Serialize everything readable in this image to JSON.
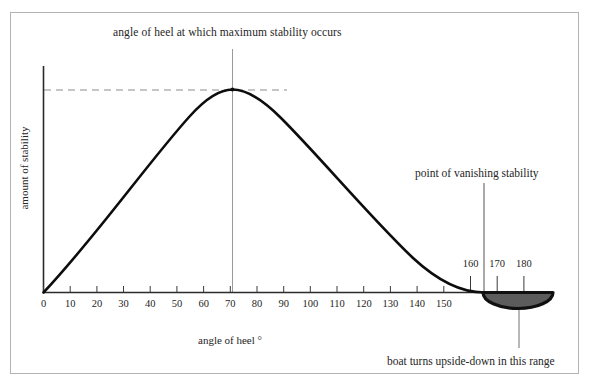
{
  "figure": {
    "title": "angle of heel at which maximum stability occurs",
    "annotation_vanishing": "point of vanishing stability",
    "annotation_boat": "boat turns upside-down in this range",
    "x_axis_title": "angle of heel °",
    "y_axis_title": "amount of stability"
  },
  "chart_data": {
    "type": "line",
    "title": "angle of heel at which maximum stability occurs",
    "xlabel": "angle of heel °",
    "ylabel": "amount of stability",
    "xlim": [
      0,
      180
    ],
    "ylim": [
      0,
      1.15
    ],
    "grid": false,
    "legend": null,
    "x_ticks": [
      0,
      10,
      20,
      30,
      40,
      50,
      60,
      70,
      80,
      90,
      100,
      110,
      120,
      130,
      140,
      150
    ],
    "x_ticks_upper": [
      160,
      170,
      180
    ],
    "y_ticks": [],
    "series": [
      {
        "name": "righting moment curve",
        "x": [
          0,
          10,
          20,
          30,
          40,
          50,
          60,
          67,
          70,
          80,
          90,
          100,
          110,
          120,
          130,
          140,
          150,
          160,
          165
        ],
        "values": [
          0.0,
          0.24,
          0.47,
          0.67,
          0.83,
          0.94,
          0.995,
          1.0,
          0.995,
          0.96,
          0.89,
          0.79,
          0.66,
          0.51,
          0.36,
          0.22,
          0.09,
          0.01,
          0.0
        ]
      }
    ],
    "annotations": [
      {
        "label": "angle of heel at which maximum stability occurs",
        "x": 67,
        "y": 1.0,
        "kind": "peak-callout"
      },
      {
        "label": "point of vanishing stability",
        "x": 165,
        "y": 0.0,
        "kind": "zero-crossing-callout"
      },
      {
        "label": "boat turns upside-down in this range",
        "x": 178,
        "y": -0.18,
        "kind": "region-callout"
      }
    ],
    "max_stability_angle": 67,
    "vanishing_stability_angle": 165,
    "inverted_range": [
      165,
      180
    ],
    "colors": {
      "curve": "#0d0d0d",
      "axis": "#333333",
      "hull_fill": "#5c5c5c",
      "hull_outline": "#0d0d0d",
      "guide": "#8d8d8d",
      "frame": "#b3b3b3"
    }
  }
}
